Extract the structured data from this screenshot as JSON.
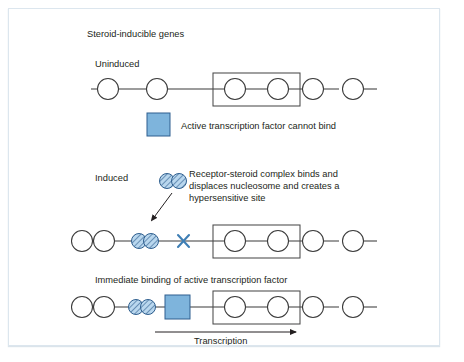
{
  "figure": {
    "title": "Steroid-inducible genes",
    "colors": {
      "transcription_factor_blue": "#7eb4dc",
      "complex_fill": "#b9d7ee",
      "hatch_stroke": "#2f5f8f",
      "outline_gray": "#3b3b3b",
      "frame_border": "#dce6ee"
    },
    "panels": [
      {
        "id": "uninduced",
        "label": "Uninduced",
        "legend": {
          "swatch": "blue-square",
          "text": "Active transcription factor cannot bind"
        },
        "chromatin": {
          "nucleosomes": 6,
          "boxed_nucleosome_indices": [
            3,
            4
          ],
          "complex_count": 0,
          "has_hypersensitive_site": false,
          "has_bound_factor": false
        }
      },
      {
        "id": "induced",
        "label": "Induced",
        "annotation": {
          "lines": [
            "Receptor-steroid complex binds and",
            "displaces nucleosome and creates a",
            "hypersensitive site"
          ],
          "points_to": "receptor-steroid-complex"
        },
        "chromatin": {
          "nucleosomes": 4,
          "boxed_nucleosome_indices": [
            3,
            4
          ],
          "complex_count": 2,
          "has_hypersensitive_site": true,
          "has_bound_factor": false
        }
      },
      {
        "id": "factor-bound",
        "label": "Immediate binding of active transcription factor",
        "chromatin": {
          "nucleosomes": 4,
          "boxed_nucleosome_indices": [
            3,
            4
          ],
          "complex_count": 2,
          "has_hypersensitive_site": false,
          "has_bound_factor": true
        },
        "arrow_label": "Transcription"
      }
    ]
  }
}
